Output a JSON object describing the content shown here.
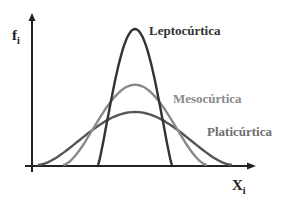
{
  "diagram": {
    "y_axis_label": {
      "base": "f",
      "sub": "i"
    },
    "x_axis_label": {
      "base": "X",
      "sub": "i"
    },
    "curves": [
      {
        "id": "leptocurtica",
        "label": "Leptocúrtica",
        "color": "#333333",
        "relative_peak_height": 1.0,
        "relative_spread": 0.38
      },
      {
        "id": "mesocurtica",
        "label": "Mesocúrtica",
        "color": "#8a8a8a",
        "relative_peak_height": 0.59,
        "relative_spread": 0.74
      },
      {
        "id": "platicurtica",
        "label": "Platicúrtica",
        "color": "#555555",
        "relative_peak_height": 0.39,
        "relative_spread": 1.0
      }
    ],
    "label_colors": {
      "leptocurtica": "#333333",
      "mesocurtica": "#8a8a8a",
      "platicurtica": "#707070"
    }
  }
}
